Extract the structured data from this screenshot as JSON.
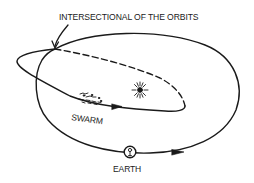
{
  "diagram": {
    "title": "INTERSECTIONAL OF THE ORBITS",
    "labels": {
      "swarm": "SWARM",
      "earth": "EARTH"
    },
    "elements": [
      {
        "id": "earth-orbit",
        "type": "closed-ellipse",
        "style": "solid",
        "direction": "counterclockwise-shown-left-to-right-at-bottom"
      },
      {
        "id": "swarm-orbit",
        "type": "elongated-ellipse",
        "style": "solid-near-side, dashed-far-side"
      },
      {
        "id": "sun",
        "type": "starburst",
        "position": "focus of swarm orbit"
      },
      {
        "id": "swarm",
        "type": "particle cluster",
        "position": "on swarm orbit lower branch"
      },
      {
        "id": "earth",
        "type": "circle with earth symbol",
        "position": "bottom of earth orbit"
      },
      {
        "id": "intersection-pointer",
        "type": "curved arrow",
        "target": "crossing of orbits"
      }
    ],
    "colors": {
      "ink": "#1a1a1a",
      "background": "#ffffff"
    }
  }
}
